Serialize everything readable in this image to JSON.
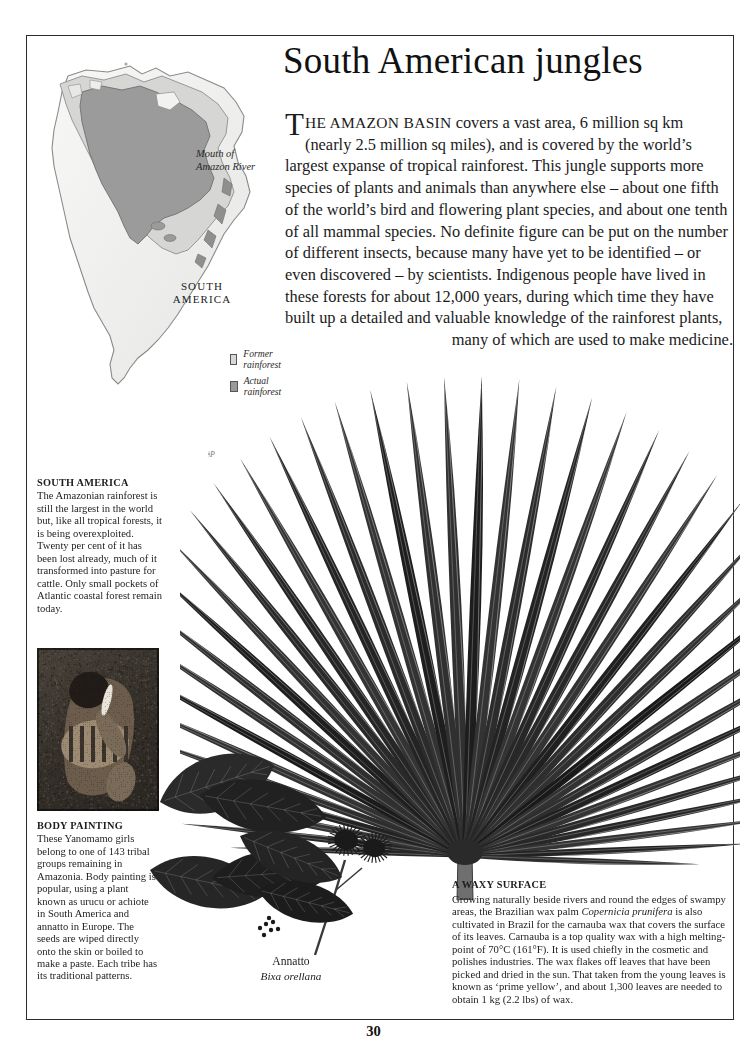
{
  "page": {
    "title": "South American jungles",
    "folio": "30"
  },
  "intro": {
    "dropcap": "T",
    "smallcaps": "HE AMAZON BASIN",
    "body": " covers a vast area, 6 million sq km (nearly 2.5 million sq miles), and is covered by the world’s largest expanse of tropical rainforest. This jungle supports more species of plants and animals than anywhere else – about one fifth of the world’s bird and flowering plant species, and about one tenth of all mammal species. No definite figure can be put on the number of different insects, because many have yet to be identified – or even discovered – by scientists. Indigenous people have lived in these forests for about 12,000 years, during which time they have built up a detailed and valuable knowledge of the rainforest plants,",
    "tail": "many of which are used to make medicine."
  },
  "map": {
    "label_mouth": "Mouth of\nAmazon River",
    "label_continent": "SOUTH\nAMERICA",
    "legend": [
      {
        "label": "Former rainforest",
        "color": "#d8d8d8"
      },
      {
        "label": "Actual rainforest",
        "color": "#9a9a9a"
      }
    ]
  },
  "captions": {
    "south_america": {
      "heading": "SOUTH AMERICA",
      "text": "The Amazonian rainforest is still the largest in the world but, like all tropical forests, it is being overexploited. Twenty per cent of it has been lost already, much of it transformed into pasture for cattle. Only small pockets of Atlantic coastal forest remain today."
    },
    "body_painting": {
      "heading": "BODY PAINTING",
      "text": "These Yanomamo girls belong to one of 143 tribal groups remaining in Amazonia. Body painting is popular, using a plant known as urucu or achiote in South America and annatto in Europe. The seeds are wiped directly onto the skin or boiled to make a paste. Each tribe has its traditional patterns."
    },
    "waxy_surface": {
      "heading": "A WAXY SURFACE",
      "text_part1": "Growing naturally beside rivers and round the edges of swampy areas, the Brazilian wax palm ",
      "species": "Copernicia prunifera",
      "text_part2": " is also cultivated in Brazil for the carnauba wax that covers the surface of its leaves. Carnauba is a top quality wax with a high melting-point of 70°C (161°F). It is used chiefly in the cosmetic and polishes industries. The wax flakes off leaves that have been picked and dried in the sun. That taken from the young leaves is known as ‘prime yellow’, and about 1,300 leaves are needed to obtain 1 kg (2.2 lbs) of wax."
    }
  },
  "specimen": {
    "common_name": "Annatto",
    "scientific_name": "Bixa orellana"
  },
  "marks": {
    "pencil_note": "ǂP"
  },
  "colors": {
    "ink": "#1a1a1a",
    "rule": "#2b2b2b",
    "map_land": "#f0f0ee",
    "map_former": "#d8d8d8",
    "map_actual": "#9a9a9a",
    "leaf_dark": "#262626"
  }
}
